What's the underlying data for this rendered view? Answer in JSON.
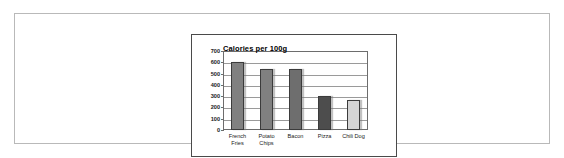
{
  "document": {
    "background_color": "#ffffff",
    "frame_color": "#b9b9b9"
  },
  "chart_frame": {
    "border_color": "#4a4a4a"
  },
  "chart_data": {
    "type": "bar",
    "title": "Calories per 100g",
    "xlabel": "",
    "ylabel": "",
    "categories": [
      "French Fries",
      "Potato Chips",
      "Bacon",
      "Pizza",
      "Chili Dog"
    ],
    "category_lines": [
      [
        "French",
        "Fries"
      ],
      [
        "Potato",
        "Chips"
      ],
      [
        "Bacon",
        ""
      ],
      [
        "Pizza",
        ""
      ],
      [
        "Chili Dog",
        ""
      ]
    ],
    "values": [
      605,
      545,
      540,
      300,
      265
    ],
    "bar_colors": [
      "#808080",
      "#808080",
      "#6e6e6e",
      "#4d4d4d",
      "#d4d4d4"
    ],
    "bar_border_color": "#3b3b3b",
    "ylim": [
      0,
      700
    ],
    "ytick_labels": [
      "700",
      "600",
      "500",
      "400",
      "300",
      "200",
      "100",
      "0"
    ],
    "ytick_values": [
      700,
      600,
      500,
      400,
      300,
      200,
      100,
      0
    ],
    "grid": true,
    "gridline_color": "#9a9a9a",
    "legend": null,
    "legend_position": "none"
  }
}
